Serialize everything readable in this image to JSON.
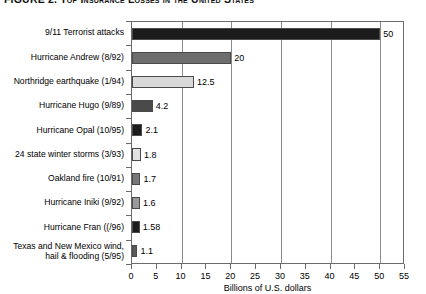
{
  "chart_data": {
    "type": "bar",
    "orientation": "horizontal",
    "title": "FIGURE 2. Top Insurance Losses in the United States",
    "xlabel": "Billions of U.S. dollars",
    "ylabel": "",
    "xlim": [
      0,
      55
    ],
    "xticks": [
      0,
      5,
      10,
      15,
      20,
      25,
      30,
      35,
      40,
      45,
      50,
      55
    ],
    "gridlines_at": [
      10,
      20,
      30,
      40,
      50
    ],
    "grid": true,
    "legend": "none",
    "categories": [
      "9/11 Terrorist attacks",
      "Hurricane Andrew (8/92)",
      "Northridge earthquake (1/94)",
      "Hurricane Hugo (9/89)",
      "Hurricane Opal (10/95)",
      "24 state winter storms (3/93)",
      "Oakland fire (10/91)",
      "Hurricane Iniki (9/92)",
      "Hurricane Fran ((/96)",
      "Texas and New Mexico wind, hail & flooding (5/95)"
    ],
    "values": [
      50,
      20,
      12.5,
      4.2,
      2.1,
      1.8,
      1.7,
      1.6,
      1.58,
      1.1
    ],
    "value_labels": [
      "50",
      "20",
      "12.5",
      "4.2",
      "2.1",
      "1.8",
      "1.7",
      "1.6",
      "1.58",
      "1.1"
    ],
    "bar_colors": [
      "#1c1c1c",
      "#6e6e6e",
      "#d9d9d9",
      "#4a4a4a",
      "#1c1c1c",
      "#e2e2e2",
      "#777777",
      "#9a9a9a",
      "#1c1c1c",
      "#5a5a5a"
    ]
  }
}
